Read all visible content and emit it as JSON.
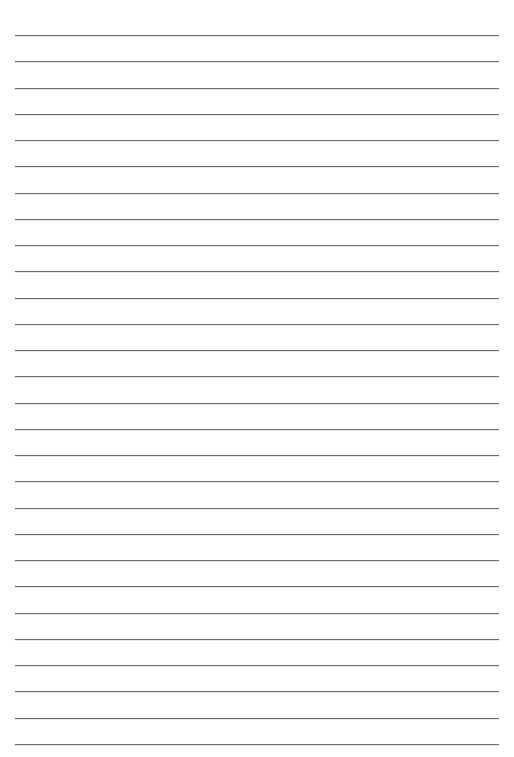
{
  "page": {
    "type": "lined-paper",
    "background_color": "#ffffff",
    "line_color": "#6f6f6f",
    "line_count": 28,
    "first_line_y": 35,
    "line_spacing": 26.25,
    "line_left": 15,
    "line_right": 499
  }
}
